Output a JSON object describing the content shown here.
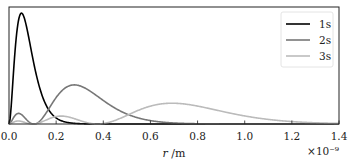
{
  "chart_data": {
    "type": "line",
    "title": "",
    "xlabel": "r /m",
    "ylabel": "",
    "x_scale_note": "×10⁻⁹",
    "xlim": [
      0.0,
      1.4
    ],
    "ylim": [
      0,
      0.56
    ],
    "grid": false,
    "legend_position": "upper right",
    "x_ticks": [
      "0.0",
      "0.2",
      "0.4",
      "0.6",
      "0.8",
      "1.0",
      "1.2",
      "1.4"
    ],
    "y_ticks": [],
    "series": [
      {
        "name": "1s",
        "color": "#000000",
        "width": 1.6,
        "n": 1,
        "peak_r": 0.053,
        "peak_value": 0.54
      },
      {
        "name": "2s",
        "color": "#777777",
        "width": 1.6,
        "n": 2,
        "peak_r": 0.277,
        "peak_value": 0.19
      },
      {
        "name": "3s",
        "color": "#bbbbbb",
        "width": 1.6,
        "n": 3,
        "peak_r": 0.69,
        "peak_value": 0.105
      }
    ],
    "a0_nm": 0.0529
  }
}
